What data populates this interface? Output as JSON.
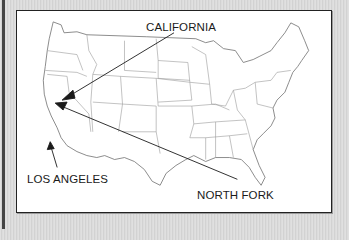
{
  "map": {
    "title": "United States outline map",
    "labels": [
      {
        "id": "california",
        "text": "CALIFORNIA"
      },
      {
        "id": "los_angeles",
        "text": "LOS ANGELES"
      },
      {
        "id": "north_fork",
        "text": "NORTH FORK"
      }
    ],
    "colors": {
      "background": "#d9d9d9",
      "frame_fill": "#ffffff",
      "frame_border": "#222222",
      "state_lines": "#8a8a8a",
      "arrows": "#1a1a1a"
    }
  }
}
